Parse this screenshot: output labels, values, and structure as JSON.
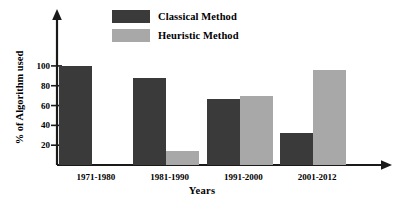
{
  "chart_data": {
    "type": "bar",
    "title": "",
    "xlabel": "Years",
    "ylabel": "%  of  Algorithm used",
    "categories": [
      "1971-1980",
      "1981-1990",
      "1991-2000",
      "2001-2012"
    ],
    "series": [
      {
        "name": "Classical Method",
        "color": "#3a3a3a",
        "values": [
          100,
          88,
          67,
          32
        ]
      },
      {
        "name": "Heuristic Method",
        "color": "#a8a8a8",
        "values": [
          0,
          14,
          70,
          96
        ]
      }
    ],
    "ylim": [
      0,
      110
    ],
    "yticks": [
      20,
      40,
      60,
      80,
      100
    ],
    "ytick_labels": [
      "20",
      "40",
      "60",
      "80",
      "100"
    ],
    "grid": false,
    "legend_position": "top-center",
    "axis_color": "#1a1a1a",
    "background": "#ffffff"
  },
  "legend": {
    "entries": [
      {
        "label": "Classical Method",
        "color": "#3a3a3a"
      },
      {
        "label": "Heuristic Method",
        "color": "#a8a8a8"
      }
    ]
  }
}
